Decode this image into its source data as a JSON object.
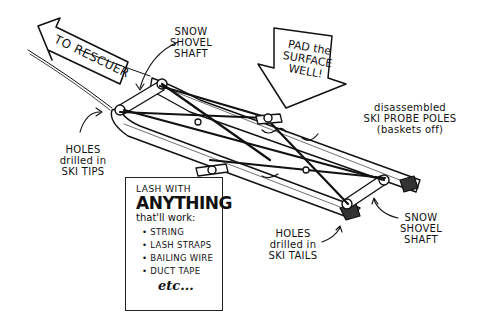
{
  "diagram": {
    "type": "illustration"
  },
  "labels": {
    "to_rescuer": "TO RESCUER",
    "pad_surface": {
      "line1": "PAD the",
      "line2": "SURFACE",
      "line3": "WELL!"
    },
    "shovel_shaft_top": {
      "line1": "SNOW",
      "line2": "SHOVEL",
      "line3": "SHAFT"
    },
    "shovel_shaft_bottom": {
      "line1": "SNOW",
      "line2": "SHOVEL",
      "line3": "SHAFT"
    },
    "probe_poles": {
      "line1": "disassembled",
      "line2": "SKI PROBE POLES",
      "line3": "(baskets off)"
    },
    "holes_tips": {
      "line1": "HOLES",
      "line2": "drilled in",
      "line3": "SKI TIPS"
    },
    "holes_tails": {
      "line1": "HOLES",
      "line2": "drilled in",
      "line3": "SKI TAILS"
    }
  },
  "lash_box": {
    "line1": "LASH WITH",
    "line2": "ANYTHING",
    "line3": "that'll work:",
    "items": [
      "STRING",
      "LASH STRAPS",
      "BAILING WIRE",
      "DUCT TAPE"
    ],
    "etc": "etc..."
  },
  "colors": {
    "ink": "#111111",
    "paper": "#ffffff"
  }
}
